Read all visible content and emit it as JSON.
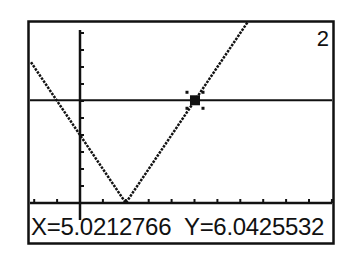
{
  "calculator": {
    "graph_number": "2",
    "trace": {
      "x_label": "X=5.0212766",
      "y_label": "Y=6.0425532",
      "x_value": 5.0212766,
      "y_value": 6.0425532
    },
    "colors": {
      "ink": "#111111",
      "background": "#ffffff"
    }
  },
  "chart_data": {
    "type": "line",
    "title": "",
    "xlabel": "",
    "ylabel": "",
    "xlim": [
      -2.27,
      11.1
    ],
    "ylim": [
      -0.6,
      10.7
    ],
    "grid": false,
    "x_tick_step": 1,
    "y_tick_step": 1,
    "series": [
      {
        "name": "Y1 = |2X-4|",
        "x": [
          -2.14,
          2,
          7.5
        ],
        "y": [
          8.28,
          0,
          11
        ]
      },
      {
        "name": "Y2 = 6.04 (horizontal)",
        "x": [
          -2.27,
          11.1
        ],
        "y": [
          6.04,
          6.04
        ]
      }
    ],
    "annotations": [
      {
        "type": "trace-cursor",
        "x": 5.0212766,
        "y": 6.0425532,
        "label": "X=5.0212766 Y=6.0425532"
      }
    ]
  }
}
